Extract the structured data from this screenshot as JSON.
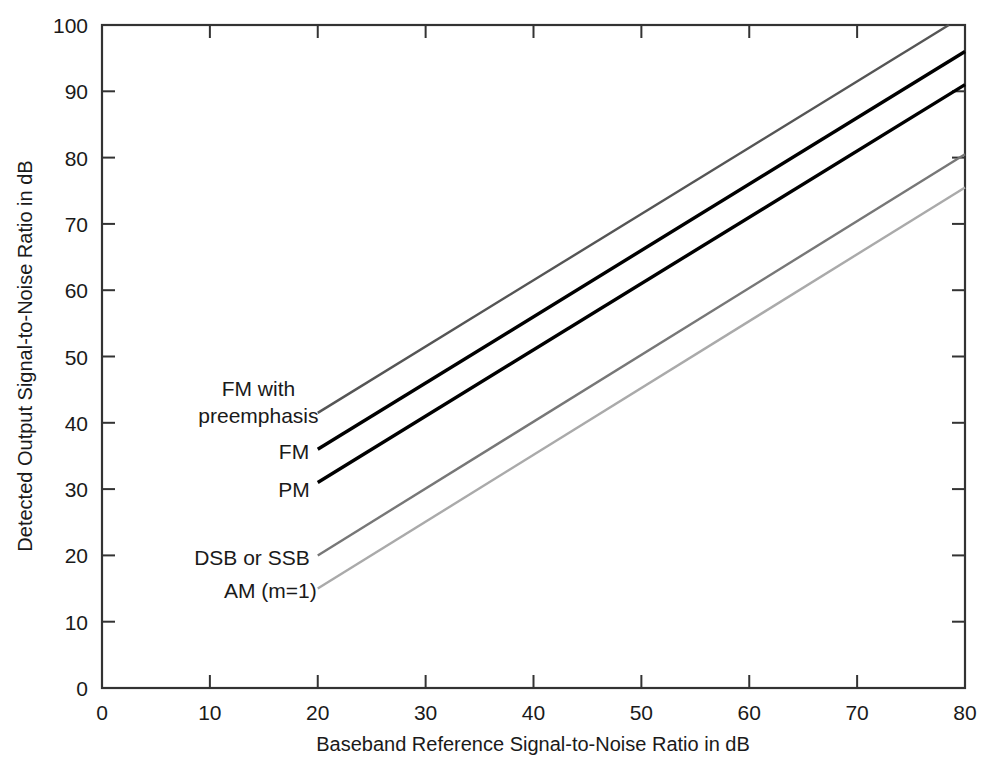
{
  "chart_data": {
    "type": "line",
    "title": "",
    "xlabel": "Baseband Reference Signal-to-Noise Ratio in dB",
    "ylabel": "Detected Output Signal-to-Noise Ratio in dB",
    "xlim": [
      0,
      80
    ],
    "ylim": [
      0,
      100
    ],
    "xticks": [
      0,
      10,
      20,
      30,
      40,
      50,
      60,
      70,
      80
    ],
    "yticks": [
      0,
      10,
      20,
      30,
      40,
      50,
      60,
      70,
      80,
      90,
      100
    ],
    "xtick_labels": [
      "0",
      "10",
      "20",
      "30",
      "40",
      "50",
      "60",
      "70",
      "80"
    ],
    "ytick_labels": [
      "0",
      "10",
      "20",
      "30",
      "40",
      "50",
      "60",
      "70",
      "80",
      "90",
      "100"
    ],
    "grid": false,
    "legend_position": "inline-annotations",
    "series": [
      {
        "name": "FM with preemphasis",
        "color": "#555555",
        "width": 2.4,
        "x": [
          20,
          80
        ],
        "y": [
          41.5,
          101.5
        ]
      },
      {
        "name": "FM",
        "color": "#000000",
        "width": 3.4,
        "x": [
          20,
          80
        ],
        "y": [
          36,
          96
        ]
      },
      {
        "name": "PM",
        "color": "#000000",
        "width": 3.4,
        "x": [
          20,
          80
        ],
        "y": [
          31,
          91
        ]
      },
      {
        "name": "DSB or SSB",
        "color": "#777777",
        "width": 2.4,
        "x": [
          20,
          80
        ],
        "y": [
          20,
          80.5
        ]
      },
      {
        "name": "AM (m=1)",
        "color": "#aaaaaa",
        "width": 2.4,
        "x": [
          20,
          80
        ],
        "y": [
          15,
          75.5
        ]
      }
    ],
    "annotations": [
      {
        "text": "FM with",
        "x": 14.5,
        "y": 44.0,
        "anchor": "middle"
      },
      {
        "text": "preemphasis",
        "x": 14.5,
        "y": 40.0,
        "anchor": "middle"
      },
      {
        "text": "FM",
        "x": 17.8,
        "y": 34.5,
        "anchor": "middle"
      },
      {
        "text": "PM",
        "x": 17.8,
        "y": 28.8,
        "anchor": "middle"
      },
      {
        "text": "DSB or SSB",
        "x": 13.9,
        "y": 18.6,
        "anchor": "middle"
      },
      {
        "text": "AM (m=1)",
        "x": 15.6,
        "y": 13.6,
        "anchor": "middle"
      }
    ]
  },
  "axes": {
    "frame_color": "#333333",
    "origin_x_label": "0",
    "origin_y_label": "0"
  }
}
